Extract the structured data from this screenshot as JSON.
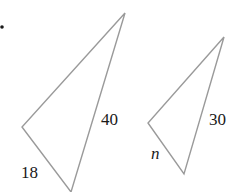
{
  "diagram": {
    "bullet": true,
    "triangles": [
      {
        "name": "large-triangle",
        "vertices": [
          [
            125,
            13
          ],
          [
            22,
            127
          ],
          [
            71,
            192
          ]
        ],
        "labels": [
          {
            "text": "40",
            "side": "right",
            "x": 101,
            "y": 125
          },
          {
            "text": "18",
            "side": "bottom-left",
            "x": 21,
            "y": 178
          }
        ]
      },
      {
        "name": "small-triangle",
        "vertices": [
          [
            224,
            37
          ],
          [
            148,
            123
          ],
          [
            184,
            174
          ]
        ],
        "labels": [
          {
            "text": "30",
            "side": "right",
            "x": 209,
            "y": 125
          },
          {
            "text": "n",
            "side": "bottom-left",
            "x": 151,
            "y": 159,
            "italic": true
          }
        ]
      }
    ],
    "line_color": "#9a9a9a",
    "text_color": "#1a1a1a"
  }
}
